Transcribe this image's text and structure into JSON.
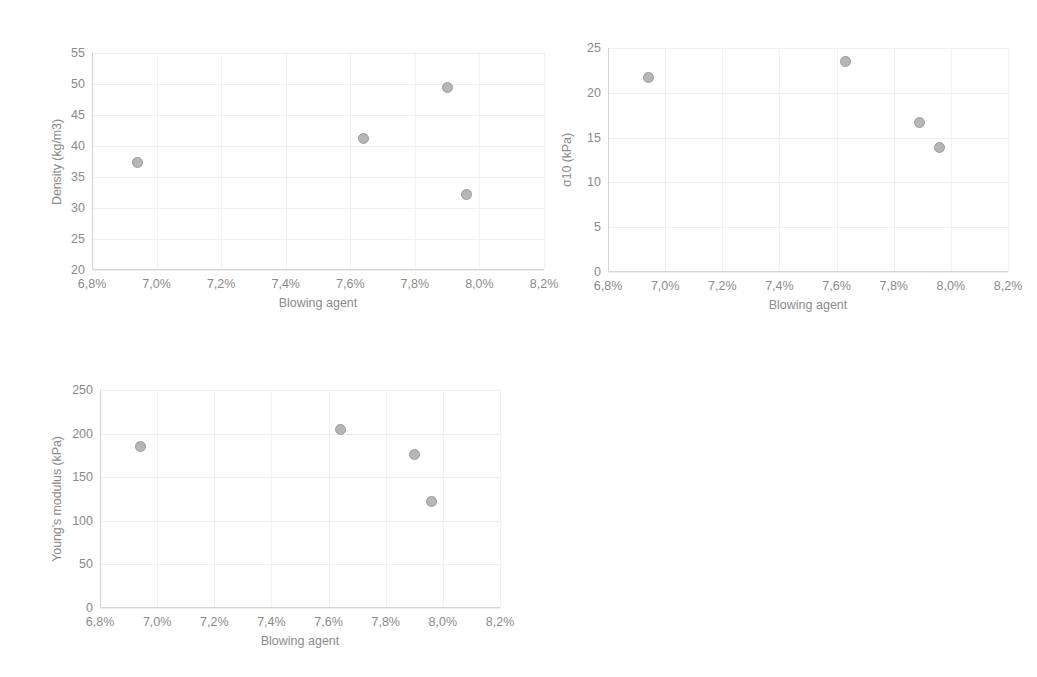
{
  "figure": {
    "background": "#ffffff",
    "marker_fill": "#b6b6b6",
    "marker_stroke": "#9c9c9c",
    "text_color": "#8a8a8a",
    "gridline_color": "#eeeeee"
  },
  "chart_data": [
    {
      "id": "density",
      "type": "scatter",
      "title": "",
      "xlabel": "Blowing agent",
      "ylabel": "Density (kg/m3)",
      "xlim": [
        6.8,
        8.2
      ],
      "ylim": [
        20,
        55
      ],
      "xticks": [
        6.8,
        7.0,
        7.2,
        7.4,
        7.6,
        7.8,
        8.0,
        8.2
      ],
      "xticklabels": [
        "6,8%",
        "7,0%",
        "7,2%",
        "7,4%",
        "7,6%",
        "7,8%",
        "8,0%",
        "8,2%"
      ],
      "yticks": [
        20,
        25,
        30,
        35,
        40,
        45,
        50,
        55
      ],
      "yticklabels": [
        "20",
        "25",
        "30",
        "35",
        "40",
        "45",
        "50",
        "55"
      ],
      "grid": true,
      "legend": false,
      "x": [
        6.94,
        7.64,
        7.9,
        7.96
      ],
      "values": [
        37.3,
        41.2,
        49.4,
        32.2
      ]
    },
    {
      "id": "sigma10",
      "type": "scatter",
      "title": "",
      "xlabel": "Blowing agent",
      "ylabel": "σ10 (kPa)",
      "xlim": [
        6.8,
        8.2
      ],
      "ylim": [
        0,
        25
      ],
      "xticks": [
        6.8,
        7.0,
        7.2,
        7.4,
        7.6,
        7.8,
        8.0,
        8.2
      ],
      "xticklabels": [
        "6,8%",
        "7,0%",
        "7,2%",
        "7,4%",
        "7,6%",
        "7,8%",
        "8,0%",
        "8,2%"
      ],
      "yticks": [
        0,
        5,
        10,
        15,
        20,
        25
      ],
      "yticklabels": [
        "0",
        "5",
        "10",
        "15",
        "20",
        "25"
      ],
      "grid": true,
      "legend": false,
      "x": [
        6.94,
        7.63,
        7.89,
        7.96
      ],
      "values": [
        21.7,
        23.5,
        16.7,
        13.9
      ]
    },
    {
      "id": "youngs-modulus",
      "type": "scatter",
      "title": "",
      "xlabel": "Blowing agent",
      "ylabel": "Young's modulus (kPa)",
      "xlim": [
        6.8,
        8.2
      ],
      "ylim": [
        0,
        250
      ],
      "xticks": [
        6.8,
        7.0,
        7.2,
        7.4,
        7.6,
        7.8,
        8.0,
        8.2
      ],
      "xticklabels": [
        "6,8%",
        "7,0%",
        "7,2%",
        "7,4%",
        "7,6%",
        "7,8%",
        "8,0%",
        "8,2%"
      ],
      "yticks": [
        0,
        50,
        100,
        150,
        200,
        250
      ],
      "yticklabels": [
        "0",
        "50",
        "100",
        "150",
        "200",
        "250"
      ],
      "grid": true,
      "legend": false,
      "x": [
        6.94,
        7.64,
        7.9,
        7.96
      ],
      "values": [
        185,
        205,
        176,
        122
      ]
    }
  ],
  "panels": [
    {
      "chart_index": 0,
      "left": 40,
      "top": 30,
      "plot_left": 92,
      "plot_top": 53,
      "plot_width": 452,
      "plot_height": 217
    },
    {
      "chart_index": 1,
      "left": 550,
      "top": 30,
      "plot_left": 608,
      "plot_top": 48,
      "plot_width": 400,
      "plot_height": 224
    },
    {
      "chart_index": 2,
      "left": 40,
      "top": 370,
      "plot_left": 100,
      "plot_top": 390,
      "plot_width": 400,
      "plot_height": 218
    }
  ]
}
